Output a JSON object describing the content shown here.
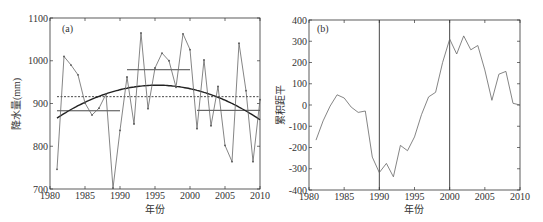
{
  "chart_data": [
    {
      "type": "line",
      "panel_label": "(a)",
      "xlabel": "年份",
      "ylabel": "降水量(mm)",
      "xlim": [
        1980,
        2010
      ],
      "ylim": [
        700,
        1100
      ],
      "xticks": [
        1980,
        1985,
        1990,
        1995,
        2000,
        2005,
        2010
      ],
      "yticks": [
        700,
        800,
        900,
        1000,
        1100
      ],
      "grid": false,
      "x": [
        1981,
        1982,
        1983,
        1984,
        1985,
        1986,
        1987,
        1988,
        1989,
        1990,
        1991,
        1992,
        1993,
        1994,
        1995,
        1996,
        1997,
        1998,
        1999,
        2000,
        2001,
        2002,
        2003,
        2004,
        2005,
        2006,
        2007,
        2008,
        2009,
        2010
      ],
      "series": [
        {
          "name": "annual precipitation",
          "style": "thin line with markers",
          "values": [
            746,
            1010,
            990,
            967,
            901,
            873,
            889,
            922,
            702,
            837,
            962,
            852,
            1065,
            888,
            983,
            1018,
            1000,
            938,
            1063,
            1026,
            841,
            1002,
            848,
            940,
            802,
            764,
            1041,
            930,
            764,
            909
          ]
        }
      ],
      "reference_lines": [
        {
          "name": "long-term mean",
          "style": "dashed",
          "y": 916,
          "x_range": [
            1981,
            2010
          ]
        },
        {
          "name": "1981-1990 mean",
          "style": "solid",
          "y": 883,
          "x_range": [
            1981,
            1990
          ]
        },
        {
          "name": "1991-2000 mean",
          "style": "solid",
          "y": 979,
          "x_range": [
            1991,
            2000
          ]
        },
        {
          "name": "2001-2010 mean",
          "style": "solid",
          "y": 884,
          "x_range": [
            2001,
            2010
          ]
        }
      ],
      "trend_curve": {
        "name": "quadratic fit",
        "style": "thick solid",
        "x": [
          1981,
          1985,
          1990,
          1995,
          2000,
          2005,
          2010
        ],
        "values": [
          866,
          902,
          933,
          944,
          934,
          906,
          863
        ]
      }
    },
    {
      "type": "line",
      "panel_label": "(b)",
      "xlabel": "年份",
      "ylabel": "累积距平",
      "xlim": [
        1980,
        2010
      ],
      "ylim": [
        -400,
        400
      ],
      "xticks": [
        1980,
        1985,
        1990,
        1995,
        2000,
        2005,
        2010
      ],
      "yticks": [
        -400,
        -300,
        -200,
        -100,
        0,
        100,
        200,
        300,
        400
      ],
      "grid": false,
      "x": [
        1981,
        1982,
        1983,
        1984,
        1985,
        1986,
        1987,
        1988,
        1989,
        1990,
        1991,
        1992,
        1993,
        1994,
        1995,
        1996,
        1997,
        1998,
        1999,
        2000,
        2001,
        2002,
        2003,
        2004,
        2005,
        2006,
        2007,
        2008,
        2009,
        2010
      ],
      "series": [
        {
          "name": "cumulative anomaly",
          "values": [
            -165,
            -75,
            -5,
            48,
            33,
            -10,
            -35,
            -28,
            -245,
            -318,
            -275,
            -338,
            -190,
            -215,
            -150,
            -45,
            38,
            60,
            200,
            310,
            240,
            325,
            260,
            280,
            165,
            22,
            145,
            158,
            8,
            0
          ]
        }
      ],
      "vertical_lines": [
        1990,
        2000
      ]
    }
  ],
  "labels": {
    "a": {
      "panel": "(a)",
      "xlabel": "年份",
      "ylabel": "降水量(mm)"
    },
    "b": {
      "panel": "(b)",
      "xlabel": "年份",
      "ylabel": "累积距平"
    }
  }
}
